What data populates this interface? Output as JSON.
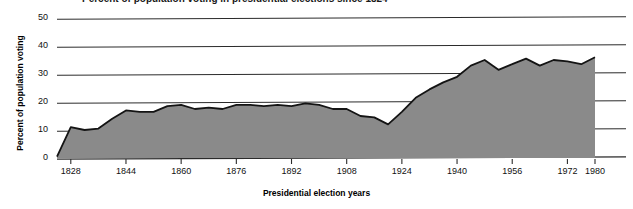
{
  "title": "Percent of population voting in presidential elections since 1824",
  "axes": {
    "ylabel": "Percent of population voting",
    "xlabel": "Presidential election years",
    "yticks": [
      "0",
      "10",
      "20",
      "30",
      "40",
      "50"
    ],
    "xticks": [
      "1828",
      "1844",
      "1860",
      "1876",
      "1892",
      "1908",
      "1924",
      "1940",
      "1956",
      "1972",
      "1980"
    ]
  },
  "colors": {
    "area_fill": "#8a8a8a",
    "line": "#141414",
    "grid": "#2b2b2b",
    "background": "#ffffff"
  },
  "chart_data": {
    "type": "area",
    "title": "Percent of population voting in presidential elections since 1824",
    "xlabel": "Presidential election years",
    "ylabel": "Percent of population voting",
    "xlim": [
      1824,
      1980
    ],
    "ylim": [
      0,
      50
    ],
    "grid": true,
    "legend": null,
    "x": [
      1824,
      1828,
      1832,
      1836,
      1840,
      1844,
      1848,
      1852,
      1856,
      1860,
      1864,
      1868,
      1872,
      1876,
      1880,
      1884,
      1888,
      1892,
      1896,
      1900,
      1904,
      1908,
      1912,
      1916,
      1920,
      1924,
      1928,
      1932,
      1936,
      1940,
      1944,
      1948,
      1952,
      1956,
      1960,
      1964,
      1968,
      1972,
      1976,
      1980
    ],
    "values": [
      0.5,
      11.0,
      10.0,
      10.5,
      14.0,
      17.0,
      16.5,
      16.5,
      18.5,
      19.0,
      17.5,
      18.0,
      17.5,
      19.0,
      19.0,
      18.5,
      19.0,
      18.5,
      19.5,
      19.0,
      17.5,
      17.5,
      15.0,
      14.5,
      12.0,
      16.5,
      21.5,
      24.5,
      27.0,
      29.0,
      33.0,
      35.0,
      31.5,
      33.5,
      35.5,
      33.0,
      35.0,
      34.5,
      33.5,
      36.0
    ],
    "series": [
      {
        "name": "Percent of population voting",
        "values": [
          0.5,
          11.0,
          10.0,
          10.5,
          14.0,
          17.0,
          16.5,
          16.5,
          18.5,
          19.0,
          17.5,
          18.0,
          17.5,
          19.0,
          19.0,
          18.5,
          19.0,
          18.5,
          19.5,
          19.0,
          17.5,
          17.5,
          15.0,
          14.5,
          12.0,
          16.5,
          21.5,
          24.5,
          27.0,
          29.0,
          33.0,
          35.0,
          31.5,
          33.5,
          35.5,
          33.0,
          35.0,
          34.5,
          33.5,
          36.0
        ]
      }
    ]
  }
}
